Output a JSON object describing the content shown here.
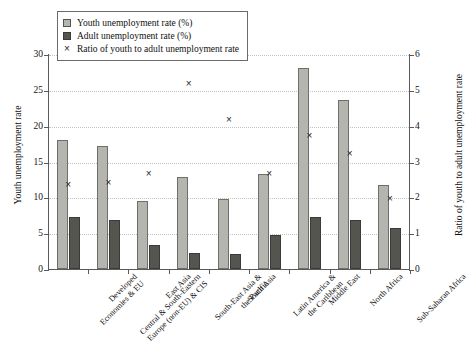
{
  "chart_data": {
    "type": "bar",
    "title": "",
    "xlabel": "",
    "ylabel": "Youth unemployment rate",
    "ylabel_secondary": "Ratio of youth to adult unemployment rate",
    "ylim": [
      0,
      30
    ],
    "ylim_secondary": [
      0,
      6
    ],
    "yticks": [
      0,
      5,
      10,
      15,
      20,
      25,
      30
    ],
    "yticks_secondary": [
      0,
      1,
      2,
      3,
      4,
      5,
      6
    ],
    "grid": true,
    "legend_position": "top-left",
    "categories": [
      "Developed Economies & EU",
      "Central & South-Eastern Europe (non-EU) & CIS",
      "East Asia",
      "South-East Asia & the Pacific",
      "South Asia",
      "Latin America & the Caribbean",
      "Middle East",
      "North Africa",
      "Sub-Saharan Africa"
    ],
    "category_lines": [
      [
        "Developed",
        "Economies & EU"
      ],
      [
        "Central & South-Eastern",
        "Europe (non-EU) & CIS"
      ],
      [
        "East Asia"
      ],
      [
        "South-East Asia &",
        "the Pacific"
      ],
      [
        "South Asia"
      ],
      [
        "Latin America &",
        "the Caribbean"
      ],
      [
        "Middle East"
      ],
      [
        "North Africa"
      ],
      [
        "Sub-Saharan Africa"
      ]
    ],
    "series": [
      {
        "name": "Youth unemployment rate (%)",
        "axis": "left",
        "kind": "bar",
        "color": "#b5b5b0",
        "values": [
          18.0,
          17.1,
          9.5,
          12.9,
          9.7,
          13.3,
          28.1,
          23.6,
          11.7
        ]
      },
      {
        "name": "Adult unemployment rate (%)",
        "axis": "left",
        "kind": "bar",
        "color": "#555550",
        "values": [
          7.3,
          6.8,
          3.4,
          2.3,
          2.1,
          4.8,
          7.3,
          6.9,
          5.7
        ]
      },
      {
        "name": "Ratio of youth to adult unemployment rate",
        "axis": "right",
        "kind": "marker",
        "marker": "×",
        "color": "#1f1f1f",
        "values": [
          2.4,
          2.45,
          2.7,
          5.2,
          4.2,
          2.7,
          3.75,
          3.25,
          2.0
        ]
      }
    ]
  }
}
